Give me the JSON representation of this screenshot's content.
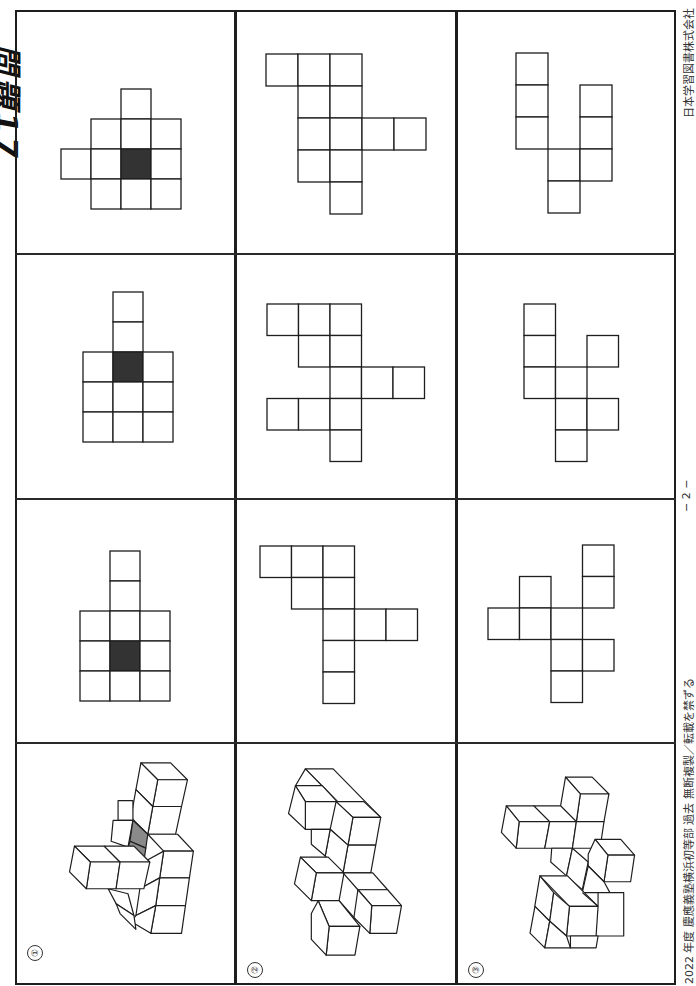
{
  "page": {
    "heading": "問題17",
    "footer": {
      "left": "2022 年度  慶應義塾横浜初等部  過去  無断複製／転載を禁ずる",
      "page_number": "− 2 −",
      "right": "日本学習図書株式会社"
    }
  },
  "colors": {
    "line": "#1e1e1e",
    "shaded_face": "#333333",
    "gray_face": "#8a8a8a",
    "background": "#ffffff"
  },
  "problems": [
    {
      "label": "①",
      "figure": "3D cube figure with one gray-shaded face",
      "nets": [
        {
          "unit": 30,
          "origin": [
            61,
            89
          ],
          "cells": [
            [
              2,
              0
            ],
            [
              1,
              1
            ],
            [
              2,
              1
            ],
            [
              3,
              1
            ],
            [
              0,
              2
            ],
            [
              1,
              2
            ],
            [
              2,
              2
            ],
            [
              3,
              2
            ],
            [
              1,
              3
            ],
            [
              2,
              3
            ],
            [
              3,
              3
            ]
          ],
          "dark": [
            [
              2,
              2
            ]
          ]
        },
        {
          "unit": 30,
          "origin": [
            83,
            292
          ],
          "cells": [
            [
              1,
              0
            ],
            [
              1,
              1
            ],
            [
              0,
              2
            ],
            [
              1,
              2
            ],
            [
              2,
              2
            ],
            [
              0,
              3
            ],
            [
              1,
              3
            ],
            [
              2,
              3
            ],
            [
              0,
              4
            ],
            [
              1,
              4
            ],
            [
              2,
              4
            ]
          ],
          "dark": [
            [
              1,
              2
            ]
          ]
        },
        {
          "unit": 30,
          "origin": [
            80,
            551
          ],
          "cells": [
            [
              1,
              0
            ],
            [
              1,
              1
            ],
            [
              0,
              2
            ],
            [
              1,
              2
            ],
            [
              2,
              2
            ],
            [
              0,
              3
            ],
            [
              1,
              3
            ],
            [
              2,
              3
            ],
            [
              0,
              4
            ],
            [
              1,
              4
            ],
            [
              2,
              4
            ]
          ],
          "dark": [
            [
              1,
              3
            ]
          ]
        }
      ]
    },
    {
      "label": "②",
      "figure": "3D cube figure",
      "nets": [
        {
          "unit": 32,
          "origin": [
            266,
            54
          ],
          "cells": [
            [
              0,
              0
            ],
            [
              1,
              0
            ],
            [
              2,
              0
            ],
            [
              1,
              1
            ],
            [
              2,
              1
            ],
            [
              1,
              2
            ],
            [
              2,
              2
            ],
            [
              3,
              2
            ],
            [
              4,
              2
            ],
            [
              1,
              3
            ],
            [
              2,
              3
            ],
            [
              2,
              4
            ]
          ],
          "dark": []
        },
        {
          "unit": 31.5,
          "origin": [
            267,
            304
          ],
          "cells": [
            [
              0,
              0
            ],
            [
              1,
              0
            ],
            [
              2,
              0
            ],
            [
              1,
              1
            ],
            [
              2,
              1
            ],
            [
              2,
              2
            ],
            [
              3,
              2
            ],
            [
              4,
              2
            ],
            [
              0,
              3
            ],
            [
              1,
              3
            ],
            [
              2,
              3
            ],
            [
              2,
              4
            ]
          ],
          "dark": []
        },
        {
          "unit": 31.5,
          "origin": [
            260,
            546
          ],
          "cells": [
            [
              0,
              0
            ],
            [
              1,
              0
            ],
            [
              2,
              0
            ],
            [
              1,
              1
            ],
            [
              2,
              1
            ],
            [
              2,
              2
            ],
            [
              3,
              2
            ],
            [
              4,
              2
            ],
            [
              2,
              3
            ],
            [
              2,
              4
            ]
          ],
          "dark": []
        }
      ]
    },
    {
      "label": "③",
      "figure": "3D cube figure",
      "nets": [
        {
          "unit": 32,
          "origin": [
            516,
            53
          ],
          "cells": [
            [
              0,
              0
            ],
            [
              0,
              1
            ],
            [
              2,
              1
            ],
            [
              0,
              2
            ],
            [
              2,
              2
            ],
            [
              1,
              3
            ],
            [
              2,
              3
            ],
            [
              1,
              4
            ]
          ],
          "dark": []
        },
        {
          "unit": 31.5,
          "origin": [
            524,
            304
          ],
          "cells": [
            [
              0,
              0
            ],
            [
              0,
              1
            ],
            [
              2,
              1
            ],
            [
              0,
              2
            ],
            [
              1,
              2
            ],
            [
              1,
              3
            ],
            [
              2,
              3
            ],
            [
              1,
              4
            ]
          ],
          "dark": []
        },
        {
          "unit": 31.5,
          "origin": [
            488,
            545
          ],
          "cells": [
            [
              3,
              0
            ],
            [
              1,
              1
            ],
            [
              3,
              1
            ],
            [
              0,
              2
            ],
            [
              1,
              2
            ],
            [
              2,
              2
            ],
            [
              2,
              3
            ],
            [
              3,
              3
            ],
            [
              2,
              4
            ]
          ],
          "dark": []
        }
      ]
    }
  ]
}
